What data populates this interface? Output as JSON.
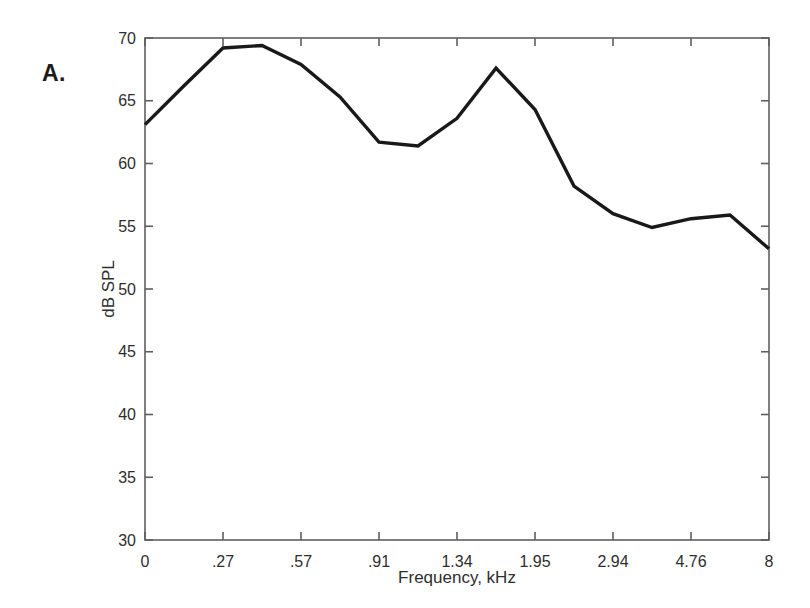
{
  "figure": {
    "panel_label": "A."
  },
  "chart_data": {
    "type": "line",
    "title": "",
    "xlabel": "Frequency, kHz",
    "ylabel": "dB SPL",
    "x_tick_labels": [
      "0",
      ".27",
      ".57",
      ".91",
      "1.34",
      "1.95",
      "2.94",
      "4.76",
      "8"
    ],
    "y_ticks": [
      30,
      35,
      40,
      45,
      50,
      55,
      60,
      65,
      70
    ],
    "ylim": [
      30,
      70
    ],
    "xlim_index": [
      0,
      8
    ],
    "grid": false,
    "legend": false,
    "x_index": [
      0,
      0.5,
      1,
      1.5,
      2,
      2.5,
      3,
      3.5,
      4,
      4.5,
      5,
      5.5,
      6,
      6.5,
      7,
      7.5,
      8
    ],
    "values": [
      63.1,
      66.2,
      69.2,
      69.4,
      67.9,
      65.3,
      61.7,
      61.4,
      63.6,
      67.6,
      64.3,
      58.2,
      56.0,
      54.9,
      55.6,
      55.9,
      53.2
    ],
    "line_color": "#191919",
    "axis_color": "#5f5f5f",
    "background_color": "#ffffff"
  }
}
